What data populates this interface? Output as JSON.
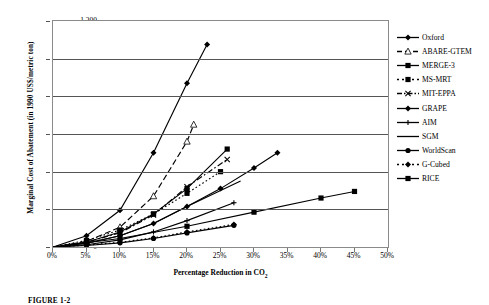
{
  "chart_data": {
    "type": "line",
    "title": "",
    "xlabel": "Percentage Reduction in CO2",
    "xlabel_main": "Percentage Reduction in CO",
    "xlabel_sub": "2",
    "ylabel": "Marginal Cost of Abatement (in 1990 US$/metric ton)",
    "xlim": [
      0,
      50
    ],
    "ylim": [
      0,
      1200
    ],
    "x_ticks": [
      "0%",
      "5%",
      "10%",
      "15%",
      "20%",
      "25%",
      "30%",
      "35%",
      "40%",
      "45%",
      "50%"
    ],
    "x_tick_values": [
      0,
      5,
      10,
      15,
      20,
      25,
      30,
      35,
      40,
      45,
      50
    ],
    "y_ticks": [
      "0",
      "200",
      "400",
      "600",
      "800",
      "1,000",
      "1,200"
    ],
    "y_tick_values": [
      0,
      200,
      400,
      600,
      800,
      1000,
      1200
    ],
    "grid": "horizontal",
    "legend_position": "right",
    "series": [
      {
        "name": "Oxford",
        "style": "solid",
        "marker": "diamond",
        "x": [
          0,
          5,
          10,
          15,
          20,
          23
        ],
        "y": [
          0,
          60,
          195,
          500,
          870,
          1075
        ]
      },
      {
        "name": "ABARE-GTEM",
        "style": "dashed",
        "marker": "triangle",
        "x": [
          0,
          5,
          10,
          15,
          20,
          21
        ],
        "y": [
          0,
          30,
          105,
          270,
          560,
          650
        ]
      },
      {
        "name": "MERGE-3",
        "style": "solid",
        "marker": "square",
        "x": [
          0,
          5,
          10,
          15,
          20,
          26
        ],
        "y": [
          0,
          25,
          80,
          175,
          310,
          520
        ]
      },
      {
        "name": "MS-MRT",
        "style": "dotted",
        "marker": "square",
        "x": [
          0,
          5,
          10,
          15,
          20,
          25
        ],
        "y": [
          0,
          35,
          90,
          175,
          285,
          400
        ]
      },
      {
        "name": "MIT-EPPA",
        "style": "dashdot",
        "marker": "cross",
        "x": [
          0,
          5,
          10,
          15,
          20,
          26
        ],
        "y": [
          0,
          25,
          75,
          170,
          320,
          465
        ]
      },
      {
        "name": "GRAPE",
        "style": "solid",
        "marker": "diamond",
        "x": [
          0,
          5,
          10,
          15,
          20,
          25,
          30,
          33.5
        ],
        "y": [
          0,
          20,
          60,
          125,
          215,
          310,
          420,
          500
        ]
      },
      {
        "name": "AIM",
        "style": "solid",
        "marker": "plus",
        "x": [
          0,
          5,
          10,
          15,
          20,
          27
        ],
        "y": [
          0,
          12,
          38,
          80,
          140,
          235
        ]
      },
      {
        "name": "SGM",
        "style": "solid",
        "marker": "none",
        "x": [
          0,
          5,
          10,
          15,
          20,
          28
        ],
        "y": [
          0,
          20,
          60,
          125,
          215,
          350
        ]
      },
      {
        "name": "WorldScan",
        "style": "solid",
        "marker": "circle",
        "x": [
          0,
          5,
          10,
          15,
          20,
          27
        ],
        "y": [
          0,
          8,
          22,
          45,
          75,
          115
        ]
      },
      {
        "name": "G-Cubed",
        "style": "dotted",
        "marker": "diamond",
        "x": [
          0,
          5,
          10,
          15,
          20,
          27
        ],
        "y": [
          0,
          10,
          25,
          48,
          80,
          120
        ]
      },
      {
        "name": "RICE",
        "style": "solid",
        "marker": "square",
        "x": [
          0,
          10,
          20,
          30,
          40,
          45
        ],
        "y": [
          0,
          45,
          110,
          185,
          260,
          295
        ]
      }
    ]
  },
  "caption": {
    "text": "FIGURE 1-2"
  },
  "legend": {
    "items": [
      {
        "label": "Oxford"
      },
      {
        "label": "ABARE-GTEM"
      },
      {
        "label": "MERGE-3"
      },
      {
        "label": "MS-MRT"
      },
      {
        "label": "MIT-EPPA"
      },
      {
        "label": "GRAPE"
      },
      {
        "label": "AIM"
      },
      {
        "label": "SGM"
      },
      {
        "label": "WorldScan"
      },
      {
        "label": "G-Cubed"
      },
      {
        "label": "RICE"
      }
    ]
  }
}
